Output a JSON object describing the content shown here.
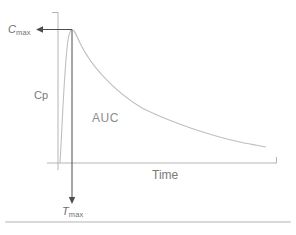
{
  "diagram": {
    "labels": {
      "cmax": {
        "base": "C",
        "sub": "max"
      },
      "tmax": {
        "base": "T",
        "sub": "max"
      },
      "y_axis": "Cp",
      "x_axis": "Time",
      "area": "AUC"
    },
    "colors": {
      "axis": "#b5b5b5",
      "curve": "#bfbfbf",
      "arrow": "#4d4d4d",
      "text": "#6f6f6f",
      "separator": "#d9d9d9"
    }
  }
}
